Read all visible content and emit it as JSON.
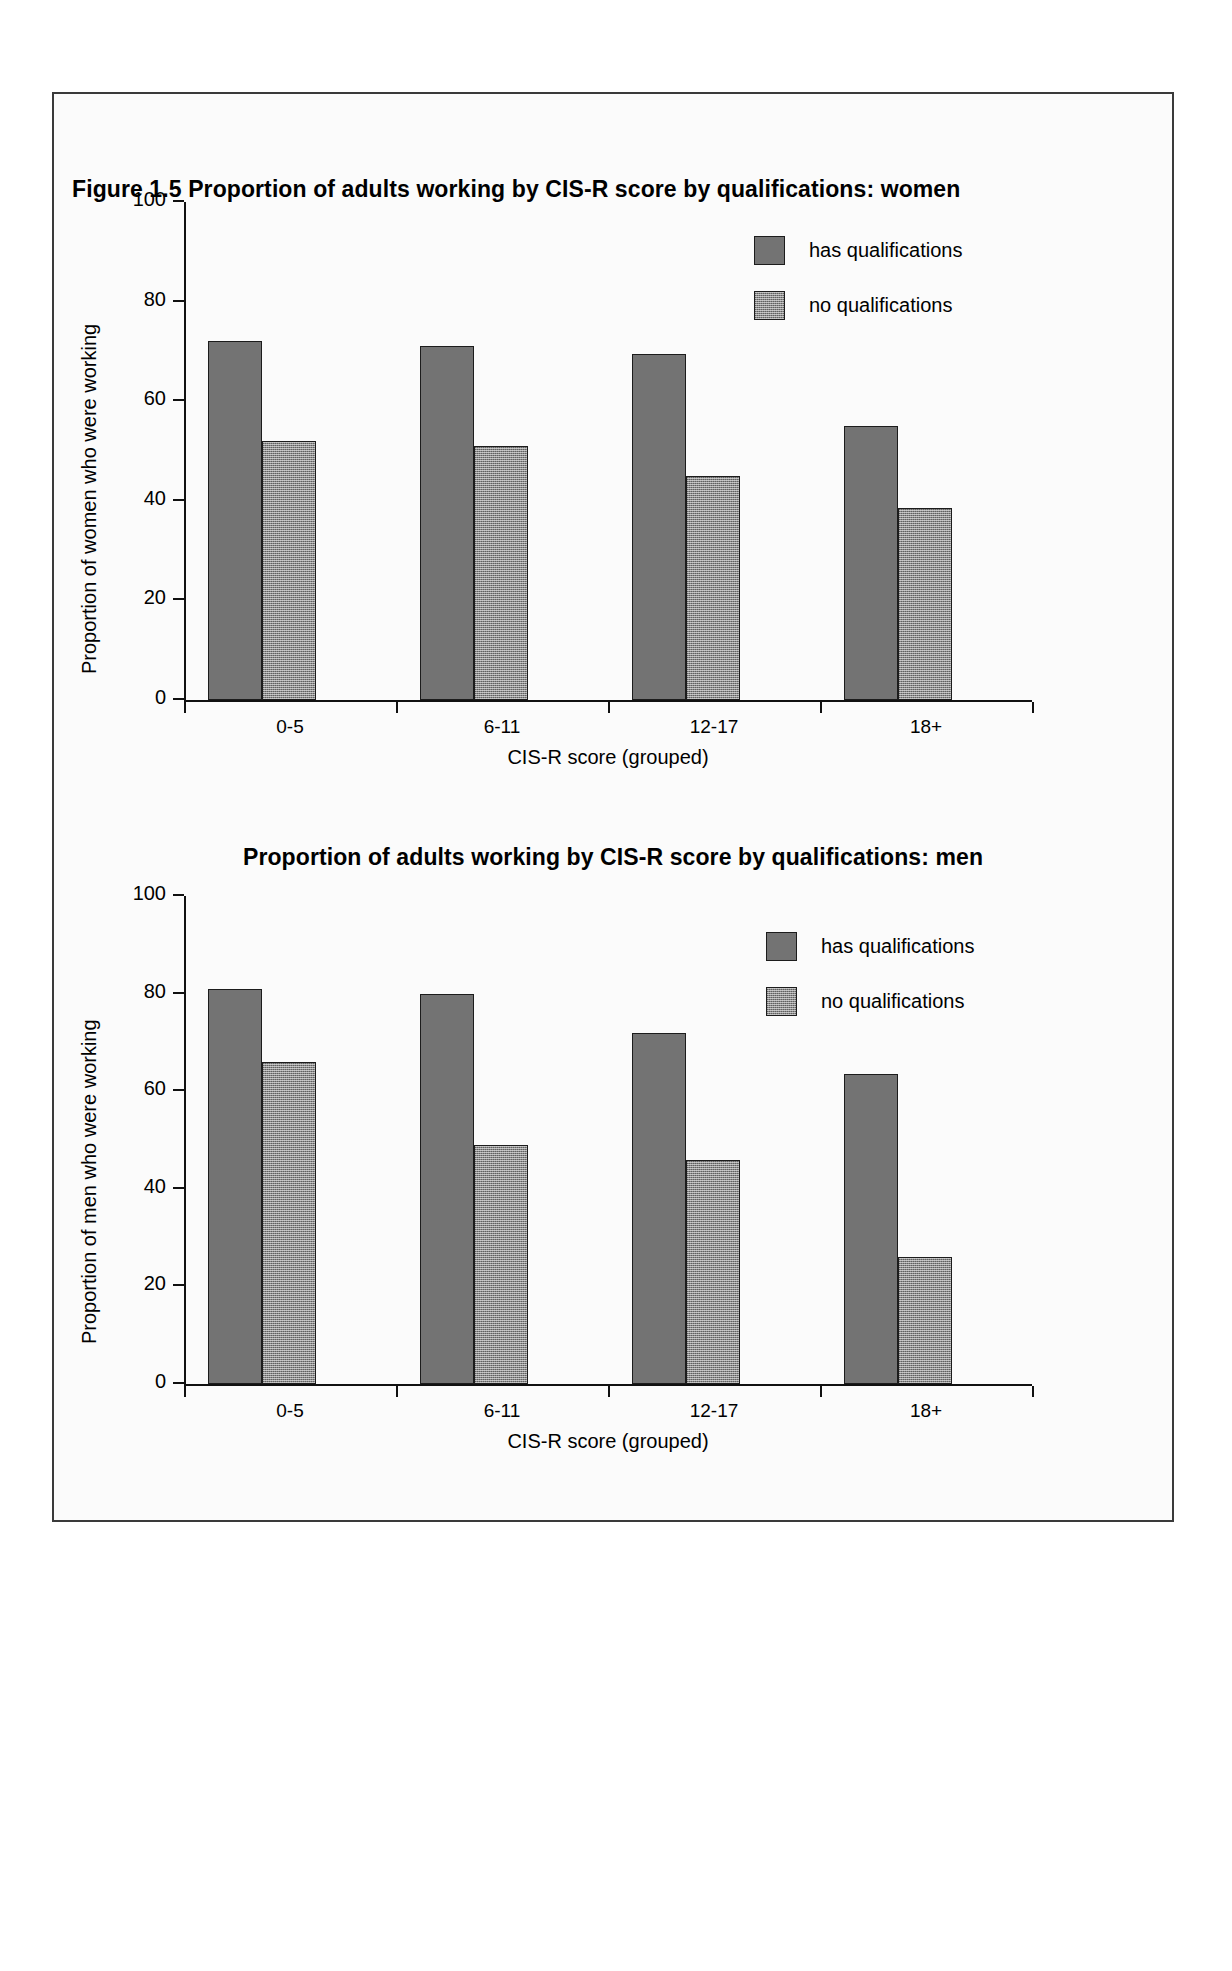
{
  "figure": {
    "label": "Figure 1.5",
    "women_title": "Figure 1.5   Proportion of adults working by CIS-R score by qualifications: women",
    "men_title": "Proportion of adults working by CIS-R score by qualifications:  men"
  },
  "colors": {
    "has_qualifications": "#737373",
    "no_qualifications": "#8a8a8a",
    "axis": "#111111",
    "frame": "#3a3a3a",
    "background": "#fbfbfb"
  },
  "chart_data": [
    {
      "type": "bar",
      "id": "women",
      "title": "Figure 1.5   Proportion of adults working by CIS-R score by qualifications: women",
      "xlabel": "CIS-R score (grouped)",
      "ylabel": "Proportion of women who were working",
      "categories": [
        "0-5",
        "6-11",
        "12-17",
        "18+"
      ],
      "ylim": [
        0,
        100
      ],
      "yticks": [
        0,
        20,
        40,
        60,
        80,
        100
      ],
      "ytick_labels": [
        "0",
        "20",
        "40",
        "60",
        "80",
        "100"
      ],
      "grid": false,
      "legend_position": "top-right",
      "series": [
        {
          "name": "has qualifications",
          "values": [
            72,
            71,
            69.5,
            55
          ]
        },
        {
          "name": "no qualifications",
          "values": [
            52,
            51,
            45,
            38.5
          ]
        }
      ]
    },
    {
      "type": "bar",
      "id": "men",
      "title": "Proportion of adults working by CIS-R score by qualifications:  men",
      "xlabel": "CIS-R score (grouped)",
      "ylabel": "Proportion of men who were working",
      "categories": [
        "0-5",
        "6-11",
        "12-17",
        "18+"
      ],
      "ylim": [
        0,
        100
      ],
      "yticks": [
        0,
        20,
        40,
        60,
        80,
        100
      ],
      "ytick_labels": [
        "0",
        "20",
        "40",
        "60",
        "80",
        "100"
      ],
      "grid": false,
      "legend_position": "top-right",
      "series": [
        {
          "name": "has qualifications",
          "values": [
            81,
            80,
            72,
            63.5
          ]
        },
        {
          "name": "no qualifications",
          "values": [
            66,
            49,
            46,
            26
          ]
        }
      ]
    }
  ]
}
